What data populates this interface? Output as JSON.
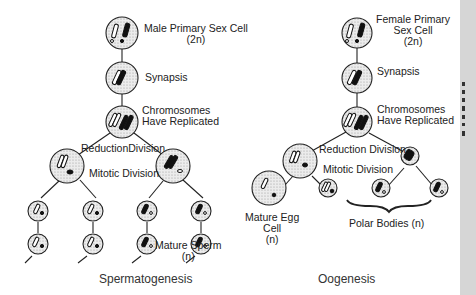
{
  "spermatogenesis": {
    "primary_cell_label": "Male Primary Sex Cell",
    "primary_cell_ploidy": "(2n)",
    "synapsis_label": "Synapsis",
    "replicated_label_1": "Chromosomes",
    "replicated_label_2": "Have Replicated",
    "reduction_label": "ReductionDivision",
    "mitotic_label": "Mitotic Division",
    "mature_label": "Mature Sperm",
    "mature_ploidy": "(n)",
    "caption": "Spermatogenesis"
  },
  "oogenesis": {
    "primary_cell_label_1": "Female Primary",
    "primary_cell_label_2": "Sex Cell",
    "primary_cell_ploidy": "(2n)",
    "synapsis_label": "Synapsis",
    "replicated_label_1": "Chromosomes",
    "replicated_label_2": "Have Replicated",
    "reduction_label": "Reduction Division",
    "mitotic_label": "Mitotic Division",
    "egg_label_1": "Mature Egg",
    "egg_label_2": "Cell",
    "egg_ploidy": "(n)",
    "polar_label": "Polar Bodies (n)",
    "caption": "Oogenesis"
  },
  "colors": {
    "cell_fill": "#e4e4e4",
    "stroke": "#222222",
    "side_strip": "#d6d6d6"
  }
}
